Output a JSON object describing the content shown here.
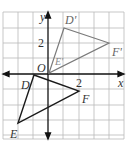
{
  "diagram": {
    "type": "coordinate-plane",
    "axes": {
      "x_label": "x",
      "y_label": "y",
      "origin_label": "O",
      "tick_label_x": "2",
      "tick_label_y": "2"
    },
    "grid": {
      "cols": 8,
      "rows": 8,
      "unit_px": 15.3,
      "origin_px": [
        48,
        74
      ],
      "color": "#b5b5b5"
    },
    "triangle_original": {
      "name": "DEF",
      "color": "#1a1a1a",
      "vertices": [
        {
          "label": "D",
          "x": -1,
          "y": 0
        },
        {
          "label": "E",
          "x": -2,
          "y": -3.2
        },
        {
          "label": "F",
          "x": 2,
          "y": -1.1
        }
      ]
    },
    "triangle_image": {
      "name": "D'E'F'",
      "color": "#7a7a7a",
      "vertices": [
        {
          "label": "D'",
          "x": 1,
          "y": 3
        },
        {
          "label": "E'",
          "x": 0,
          "y": 0
        },
        {
          "label": "F'",
          "x": 4,
          "y": 2
        }
      ]
    }
  }
}
